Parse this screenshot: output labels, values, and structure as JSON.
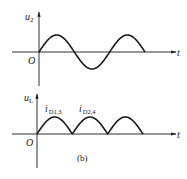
{
  "figure": {
    "caption": "(b)",
    "color": "#1a1a1a"
  },
  "top_plot": {
    "y_label_main": "u",
    "y_label_sub": "2",
    "x_label": "t",
    "origin_label": "O",
    "waveform": "sine",
    "cycles": 1.5
  },
  "bottom_plot": {
    "y_label_main": "u",
    "y_label_sub": "L",
    "x_label": "t",
    "origin_label": "O",
    "waveform": "full-wave-rectified",
    "humps": 3,
    "annotations": [
      {
        "main": "i",
        "sub": "D1,3"
      },
      {
        "main": "i",
        "sub": "D2,4"
      }
    ]
  }
}
